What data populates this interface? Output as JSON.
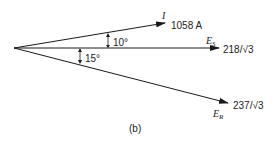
{
  "figure": {
    "caption": "(b)",
    "origin": [
      14,
      48
    ],
    "phasors": [
      {
        "id": "current",
        "symbol": "I",
        "subscript": "",
        "value_label": "1058 A",
        "angle_deg": 10,
        "direction": "leading",
        "tip": [
          165,
          23
        ]
      },
      {
        "id": "sending_voltage",
        "symbol": "E",
        "subscript": "S",
        "value_label": "218/√3",
        "angle_deg": 0,
        "direction": "reference",
        "tip": [
          219,
          48
        ]
      },
      {
        "id": "receiving_voltage",
        "symbol": "E",
        "subscript": "R",
        "value_label": "237/√3",
        "angle_deg": 15,
        "direction": "lagging",
        "tip": [
          228,
          103
        ]
      }
    ],
    "angles": [
      {
        "label": "10°",
        "between": [
          "current",
          "sending_voltage"
        ]
      },
      {
        "label": "15°",
        "between": [
          "sending_voltage",
          "receiving_voltage"
        ]
      }
    ],
    "line_color": "#1a1a1a"
  }
}
